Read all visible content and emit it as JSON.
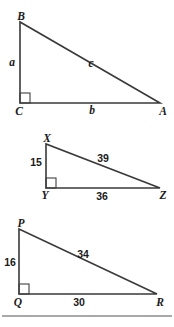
{
  "figure": {
    "background_color": "#ffffff",
    "line_color": "#3a3a3a",
    "text_color": "#1a1a1a"
  },
  "triangles": [
    {
      "id": "triangle-abc",
      "vertices": {
        "top": "B",
        "right_angle": "C",
        "right": "A"
      },
      "sides": {
        "leg_vertical": "a",
        "leg_horizontal": "b",
        "hypotenuse": "c"
      },
      "right_angle_at": "C"
    },
    {
      "id": "triangle-xyz",
      "vertices": {
        "top": "X",
        "right_angle": "Y",
        "right": "Z"
      },
      "sides": {
        "leg_vertical": "15",
        "leg_horizontal": "36",
        "hypotenuse": "39"
      },
      "right_angle_at": "Y"
    },
    {
      "id": "triangle-pqr",
      "vertices": {
        "top": "P",
        "right_angle": "Q",
        "right": "R"
      },
      "sides": {
        "leg_vertical": "16",
        "leg_horizontal": "30",
        "hypotenuse": "34"
      },
      "right_angle_at": "Q"
    }
  ]
}
